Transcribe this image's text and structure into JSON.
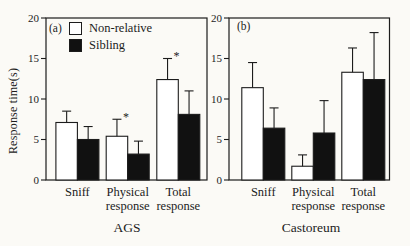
{
  "colors": {
    "line": "#1c1c1c",
    "background": "#fbfaf6",
    "non_relative_fill": "#ffffff",
    "sibling_fill": "#111111"
  },
  "chart_data": [
    {
      "type": "bar",
      "panel": "(a)",
      "title": "AGS",
      "ylabel": "Response time(s)",
      "ylim": [
        0,
        20
      ],
      "yticks": [
        0,
        5,
        10,
        15,
        20
      ],
      "grid": false,
      "legend_position": "top-left inside panel (a)",
      "categories": [
        "Sniff",
        "Physical response",
        "Total response"
      ],
      "series": [
        {
          "name": "Non-relative",
          "fill": "#ffffff",
          "values": [
            7.1,
            5.4,
            12.4
          ],
          "errors": [
            1.4,
            2.1,
            2.6
          ]
        },
        {
          "name": "Sibling",
          "fill": "#111111",
          "values": [
            5.0,
            3.2,
            8.1
          ],
          "errors": [
            1.6,
            1.6,
            2.9
          ]
        }
      ],
      "significance": [
        "",
        "*",
        "*"
      ]
    },
    {
      "type": "bar",
      "panel": "(b)",
      "title": "Castoreum",
      "ylabel": "",
      "ylim": [
        0,
        20
      ],
      "yticks": [
        0,
        5,
        10,
        15,
        20
      ],
      "grid": false,
      "categories": [
        "Sniff",
        "Physical response",
        "Total response"
      ],
      "series": [
        {
          "name": "Non-relative",
          "fill": "#ffffff",
          "values": [
            11.4,
            1.7,
            13.3
          ],
          "errors": [
            3.1,
            1.4,
            3.0
          ]
        },
        {
          "name": "Sibling",
          "fill": "#111111",
          "values": [
            6.4,
            5.8,
            12.4
          ],
          "errors": [
            2.5,
            4.0,
            5.8
          ]
        }
      ],
      "significance": [
        "",
        "",
        ""
      ]
    }
  ]
}
